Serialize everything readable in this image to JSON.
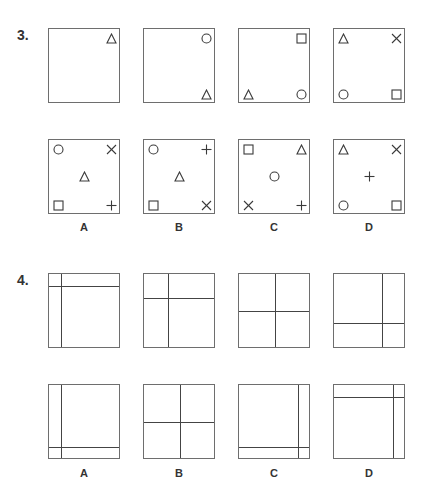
{
  "questions": [
    {
      "number": "3.",
      "type": "corner-symbols",
      "sequence": [
        {
          "tl": "",
          "tr": "triangle",
          "bl": "",
          "br": "",
          "center": ""
        },
        {
          "tl": "",
          "tr": "circle",
          "bl": "",
          "br": "triangle",
          "center": ""
        },
        {
          "tl": "",
          "tr": "square",
          "bl": "triangle",
          "br": "circle",
          "center": ""
        },
        {
          "tl": "triangle",
          "tr": "cross-x",
          "bl": "circle",
          "br": "square",
          "center": ""
        }
      ],
      "answers": [
        {
          "label": "A",
          "tl": "circle",
          "tr": "cross-x",
          "bl": "square",
          "br": "plus",
          "center": "triangle"
        },
        {
          "label": "B",
          "tl": "circle",
          "tr": "plus",
          "bl": "square",
          "br": "cross-x",
          "center": "triangle"
        },
        {
          "label": "C",
          "tl": "square",
          "tr": "triangle",
          "bl": "cross-x",
          "br": "plus",
          "center": "circle"
        },
        {
          "label": "D",
          "tl": "triangle",
          "tr": "cross-x",
          "bl": "circle",
          "br": "square",
          "center": "plus"
        }
      ]
    },
    {
      "number": "4.",
      "type": "dividing-lines",
      "sequence": [
        {
          "v": 12,
          "h": 12
        },
        {
          "v": 24,
          "h": 24
        },
        {
          "v": 36,
          "h": 37
        },
        {
          "v": 48,
          "h": 49
        }
      ],
      "answers": [
        {
          "label": "A",
          "v": 12,
          "h": 62
        },
        {
          "label": "B",
          "v": 36,
          "h": 37
        },
        {
          "label": "C",
          "v": 59,
          "h": 62
        },
        {
          "label": "D",
          "v": 59,
          "h": 12
        }
      ]
    }
  ],
  "colors": {
    "line": "#444444",
    "border": "#6e6e6e",
    "text": "#333333"
  }
}
